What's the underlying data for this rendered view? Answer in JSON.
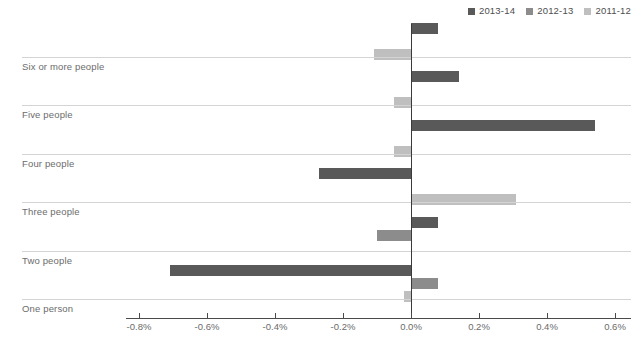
{
  "chart_data": {
    "type": "bar",
    "orientation": "horizontal",
    "title": "",
    "xlabel": "",
    "ylabel": "",
    "grid": false,
    "legend_position": "top-right",
    "xlim": [
      -0.8,
      0.6
    ],
    "xticks": [
      -0.8,
      -0.6,
      -0.4,
      -0.2,
      0.0,
      0.2,
      0.4,
      0.6
    ],
    "xtick_labels": [
      "-0.8%",
      "-0.6%",
      "-0.4%",
      "-0.2%",
      "0.0%",
      "0.2%",
      "0.4%",
      "0.6%"
    ],
    "categories": [
      "Six or more people",
      "Five people",
      "Four people",
      "Three people",
      "Two people",
      "One person"
    ],
    "series": [
      {
        "name": "2013-14",
        "color": "#595959",
        "values": [
          0.08,
          0.14,
          0.54,
          -0.27,
          0.08,
          -0.71
        ]
      },
      {
        "name": "2012-13",
        "color": "#8c8c8c",
        "values": [
          0.0,
          0.0,
          0.0,
          0.0,
          -0.1,
          0.08
        ]
      },
      {
        "name": "2011-12",
        "color": "#bfbfbf",
        "values": [
          -0.11,
          -0.05,
          -0.05,
          0.31,
          0.0,
          -0.02
        ]
      }
    ]
  },
  "legend": {
    "items": [
      {
        "label": "2013-14",
        "color": "#595959"
      },
      {
        "label": "2012-13",
        "color": "#8c8c8c"
      },
      {
        "label": "2011-12",
        "color": "#bfbfbf"
      }
    ]
  },
  "axis": {
    "tick_labels": [
      "-0.8%",
      "-0.6%",
      "-0.4%",
      "-0.2%",
      "0.0%",
      "0.2%",
      "0.4%",
      "0.6%"
    ]
  },
  "categories": [
    "Six or more people",
    "Five people",
    "Four people",
    "Three people",
    "Two people",
    "One person"
  ]
}
